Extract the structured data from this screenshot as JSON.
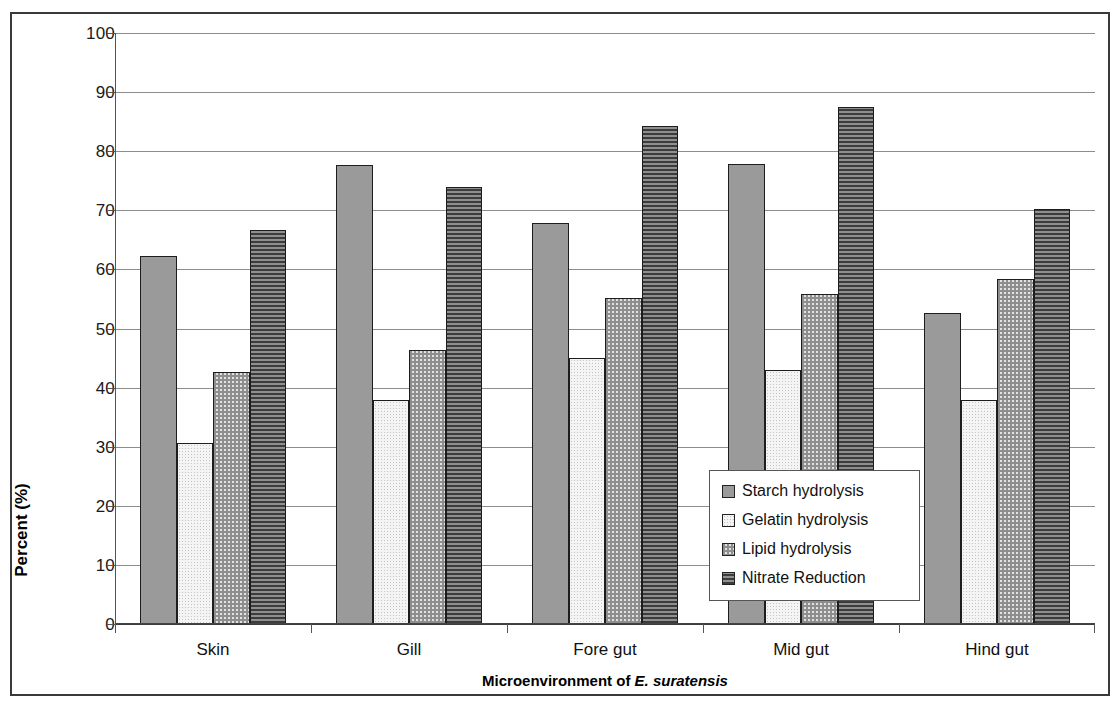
{
  "chart_data": {
    "type": "bar",
    "title": "",
    "xlabel": "Microenvironment of E. suratensis",
    "xlabel_plain": "Microenvironment of ",
    "xlabel_italic": "E. suratensis",
    "ylabel": "Percent (%)",
    "ylim": [
      0,
      100
    ],
    "ytick_step": 10,
    "yticks": [
      100,
      90,
      80,
      70,
      60,
      50,
      40,
      30,
      20,
      10,
      0
    ],
    "grid": true,
    "legend_position": "inside-right-lower",
    "categories": [
      "Skin",
      "Gill",
      "Fore gut",
      "Mid gut",
      "Hind gut"
    ],
    "series": [
      {
        "name": "Starch hydrolysis",
        "pattern": "vertical-lines",
        "color": "#9a9a9a",
        "values": [
          62.3,
          77.7,
          67.9,
          77.8,
          52.6
        ]
      },
      {
        "name": "Gelatin hydrolysis",
        "pattern": "fine-dots",
        "color": "#f4f4f4",
        "values": [
          30.7,
          37.9,
          45.0,
          43.0,
          37.9
        ]
      },
      {
        "name": "Lipid hydrolysis",
        "pattern": "checkerboard",
        "color": "#e2e2e2",
        "values": [
          42.7,
          46.4,
          55.1,
          55.8,
          58.3
        ]
      },
      {
        "name": "Nitrate Reduction",
        "pattern": "horizontal-lines",
        "color": "#6d6d6d",
        "values": [
          66.7,
          74.0,
          84.3,
          87.4,
          70.3
        ]
      }
    ]
  },
  "legend": {
    "items": [
      {
        "label": "Starch hydrolysis"
      },
      {
        "label": "Gelatin hydrolysis"
      },
      {
        "label": "Lipid hydrolysis"
      },
      {
        "label": "Nitrate Reduction"
      }
    ]
  }
}
